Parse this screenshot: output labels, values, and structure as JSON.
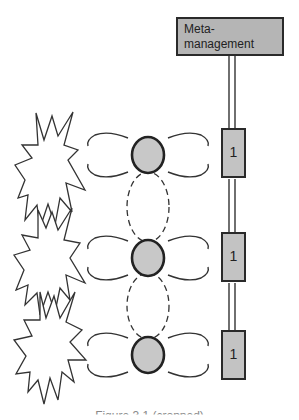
{
  "diagram": {
    "meta_box": {
      "label": "Meta-\nmanagement"
    },
    "units": [
      {
        "label": "1"
      },
      {
        "label": "1"
      },
      {
        "label": "1"
      }
    ],
    "nodes": [
      {
        "shape": "circle",
        "fill": "#c8c8c8"
      },
      {
        "shape": "circle",
        "fill": "#c8c8c8"
      },
      {
        "shape": "circle",
        "fill": "#c8c8c8"
      }
    ],
    "bursts": [
      {
        "shape": "starburst"
      },
      {
        "shape": "starburst"
      },
      {
        "shape": "starburst"
      }
    ],
    "caption": "Figure 3.1 (cropped)"
  },
  "colors": {
    "box_fill": "#b5b5b5",
    "unit_fill": "#c3c3c3",
    "node_fill": "#c8c8c8",
    "stroke": "#2a2a2a"
  }
}
